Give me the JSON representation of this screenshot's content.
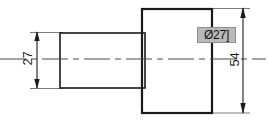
{
  "drawing": {
    "title": "Stepped shaft side view",
    "view_type": "orthographic-side-view",
    "background_color": "#ffffff",
    "line_color": "#1a1a1a",
    "centerline_color": "#4a4a4a",
    "thin_line_color": "#6b6b6b",
    "canvas": {
      "width": 268,
      "height": 122
    }
  },
  "dimensions": {
    "left": {
      "label": "27",
      "orientation": "vertical",
      "text_rotation": "-90deg",
      "line_x": 37,
      "arrow_top_y": 32,
      "arrow_bottom_y": 88,
      "measures": "shaft-diameter"
    },
    "right": {
      "label": "54",
      "orientation": "vertical",
      "text_rotation": "-90deg",
      "line_x": 243,
      "arrow_top_y": 9,
      "arrow_bottom_y": 113,
      "measures": "flange-diameter"
    }
  },
  "callout": {
    "text": "Ø27]",
    "selected": true,
    "highlight_color": "#b9b9b9",
    "border_color": "#8e8e8e",
    "text_color": "#121212"
  },
  "geometry": {
    "shaft": {
      "x": 60,
      "y": 33,
      "width": 85,
      "height": 55,
      "stroke_width": 1.6
    },
    "flange": {
      "x": 142,
      "y": 9,
      "width": 70,
      "height": 104,
      "stroke_width": 2.2
    },
    "centerline": {
      "y": 59,
      "x_start": 0,
      "x_end": 266,
      "dash_pattern": "long-dash short-dash"
    }
  }
}
